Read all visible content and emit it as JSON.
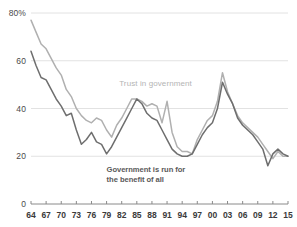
{
  "chart_data": {
    "type": "line",
    "title": "",
    "subtitle": "",
    "xlabel": "",
    "ylabel": "",
    "xlim": [
      1964,
      2015
    ],
    "ylim": [
      0,
      80
    ],
    "grid": true,
    "grid_axis": "y",
    "legend_position": "inline-annotation",
    "y_ticks": [
      0,
      20,
      40,
      60,
      80
    ],
    "y_tick_labels": [
      "0",
      "20",
      "40",
      "60",
      "80%"
    ],
    "x_ticks": [
      1964,
      1967,
      1970,
      1973,
      1976,
      1979,
      1982,
      1985,
      1988,
      1991,
      1994,
      1997,
      2000,
      2003,
      2006,
      2009,
      2012,
      2015
    ],
    "x_tick_labels": [
      "64",
      "67",
      "70",
      "73",
      "76",
      "79",
      "82",
      "85",
      "88",
      "91",
      "94",
      "97",
      "00",
      "03",
      "06",
      "09",
      "12",
      "15"
    ],
    "series": [
      {
        "name": "Trust in government",
        "color": "#b0b0b0",
        "annotation": "Trust in government",
        "x": [
          1964,
          1965,
          1966,
          1967,
          1968,
          1969,
          1970,
          1971,
          1972,
          1973,
          1974,
          1975,
          1976,
          1977,
          1978,
          1979,
          1980,
          1981,
          1982,
          1983,
          1984,
          1985,
          1986,
          1987,
          1988,
          1989,
          1990,
          1991,
          1992,
          1993,
          1994,
          1995,
          1996,
          1997,
          1998,
          1999,
          2000,
          2001,
          2002,
          2003,
          2004,
          2005,
          2006,
          2007,
          2008,
          2009,
          2010,
          2011,
          2012,
          2013,
          2014,
          2015
        ],
        "y": [
          77,
          72,
          67,
          65,
          61,
          57,
          54,
          48,
          45,
          40,
          37,
          35,
          34,
          36,
          35,
          31,
          28,
          33,
          36,
          40,
          44,
          44,
          43,
          41,
          42,
          41,
          34,
          43,
          30,
          24,
          22,
          22,
          21,
          27,
          31,
          35,
          37,
          43,
          55,
          47,
          42,
          37,
          34,
          32,
          30,
          28,
          25,
          22,
          19,
          22,
          20,
          20
        ]
      },
      {
        "name": "Government is run for the benefit of all",
        "color": "#6e6e6e",
        "annotation": "Government is run for the benefit of all",
        "x": [
          1964,
          1965,
          1966,
          1967,
          1968,
          1969,
          1970,
          1971,
          1972,
          1973,
          1974,
          1975,
          1976,
          1977,
          1978,
          1979,
          1980,
          1981,
          1982,
          1983,
          1984,
          1985,
          1986,
          1987,
          1988,
          1989,
          1990,
          1991,
          1992,
          1993,
          1994,
          1995,
          1996,
          1997,
          1998,
          1999,
          2000,
          2001,
          2002,
          2003,
          2004,
          2005,
          2006,
          2007,
          2008,
          2009,
          2010,
          2011,
          2012,
          2013,
          2014,
          2015
        ],
        "y": [
          64,
          58,
          53,
          52,
          48,
          44,
          41,
          37,
          38,
          31,
          25,
          27,
          30,
          26,
          25,
          21,
          24,
          28,
          32,
          36,
          40,
          44,
          42,
          38,
          36,
          35,
          31,
          27,
          23,
          21,
          20,
          20,
          21,
          25,
          29,
          32,
          34,
          40,
          51,
          46,
          42,
          36,
          33,
          31,
          29,
          26,
          23,
          16,
          21,
          23,
          21,
          20
        ]
      }
    ]
  },
  "annotations": {
    "trust_label": "Trust in government",
    "benefit_label_line1": "Government is run for",
    "benefit_label_line2": "the benefit of all"
  },
  "colors": {
    "trust_line": "#b0b0b0",
    "benefit_line": "#6e6e6e",
    "gridline": "#e2e2e2",
    "axis": "#8a8a8a",
    "tick_text": "#3a3a3a"
  }
}
